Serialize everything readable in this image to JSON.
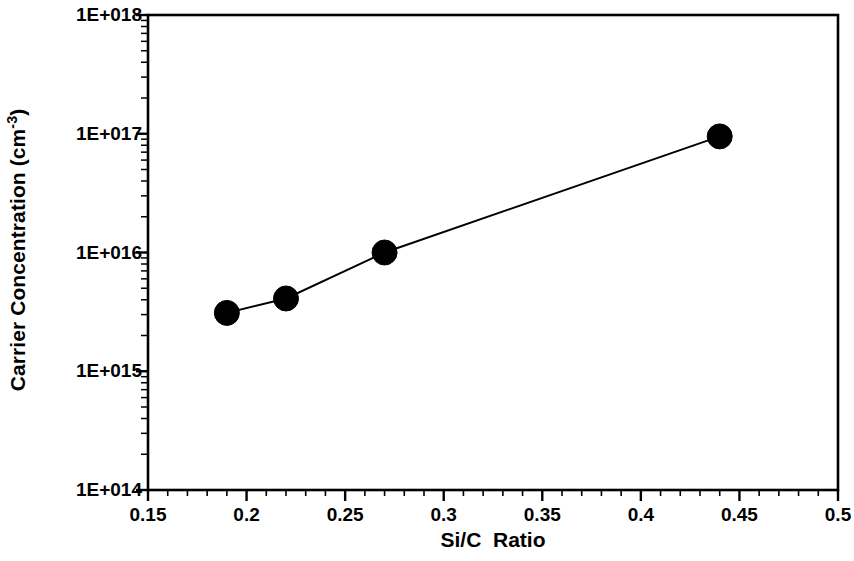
{
  "chart_data": {
    "type": "line",
    "title": "",
    "subtitle": "",
    "xlabel": "Si/C  Ratio",
    "ylabel": "Carrier Concentration (cm-3)",
    "ylabel_base": "Carrier Concentration (cm",
    "ylabel_sup": "-3",
    "ylabel_tail": ")",
    "xscale": "linear",
    "yscale": "log",
    "xlim": [
      0.15,
      0.5
    ],
    "ylim": [
      100000000000000.0,
      1e+18
    ],
    "grid": false,
    "legend": null,
    "marker": "filled-circle",
    "marker_color": "#000000",
    "line_color": "#000000",
    "x": [
      0.19,
      0.22,
      0.27,
      0.44
    ],
    "y": [
      3100000000000000.0,
      4100000000000000.0,
      1e+16,
      9.5e+16
    ],
    "points": [
      {
        "x": 0.19,
        "y": 3100000000000000.0
      },
      {
        "x": 0.22,
        "y": 4100000000000000.0
      },
      {
        "x": 0.27,
        "y": 1e+16
      },
      {
        "x": 0.44,
        "y": 9.5e+16
      }
    ],
    "xticks": [
      0.15,
      0.2,
      0.25,
      0.3,
      0.35,
      0.4,
      0.45,
      0.5
    ],
    "xtick_labels": [
      "0.15",
      "0.2",
      "0.25",
      "0.3",
      "0.35",
      "0.4",
      "0.45",
      "0.5"
    ],
    "xtick_minor_step": 0.01,
    "yticks": [
      100000000000000.0,
      1000000000000000.0,
      1e+16,
      1e+17,
      1e+18
    ],
    "ytick_labels": [
      "1E+014",
      "1E+015",
      "1E+016",
      "1E+017",
      "1E+018"
    ],
    "ytick_minor": "log-decade",
    "axes": {
      "top_spine": true,
      "right_spine": true,
      "bottom_spine": true,
      "left_spine": true,
      "ticks_inside_left": false,
      "ticks_direction": "out"
    }
  }
}
